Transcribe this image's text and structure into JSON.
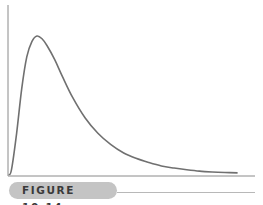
{
  "figure_label": "FIGURE 10.14",
  "colors": {
    "curve": "#707070",
    "axis": "#8a8a8a",
    "label_bg": "#c4c4c4",
    "label_text": "#3a3a3a"
  },
  "chart_data": {
    "type": "line",
    "title": "",
    "xlabel": "",
    "ylabel": "",
    "grid": false,
    "legend": "none",
    "xlim": [
      0,
      1
    ],
    "ylim": [
      0,
      1
    ],
    "series": [
      {
        "name": "distribution",
        "x": [
          0.0,
          0.01,
          0.03,
          0.05,
          0.07,
          0.09,
          0.11,
          0.13,
          0.15,
          0.18,
          0.21,
          0.25,
          0.3,
          0.35,
          0.4,
          0.45,
          0.5,
          0.55,
          0.6,
          0.65,
          0.7,
          0.75,
          0.8,
          0.85,
          0.9
        ],
        "values": [
          0.0,
          0.04,
          0.3,
          0.62,
          0.85,
          0.96,
          1.0,
          0.98,
          0.93,
          0.83,
          0.71,
          0.56,
          0.41,
          0.3,
          0.22,
          0.16,
          0.12,
          0.09,
          0.065,
          0.05,
          0.038,
          0.028,
          0.022,
          0.018,
          0.015
        ]
      }
    ]
  }
}
